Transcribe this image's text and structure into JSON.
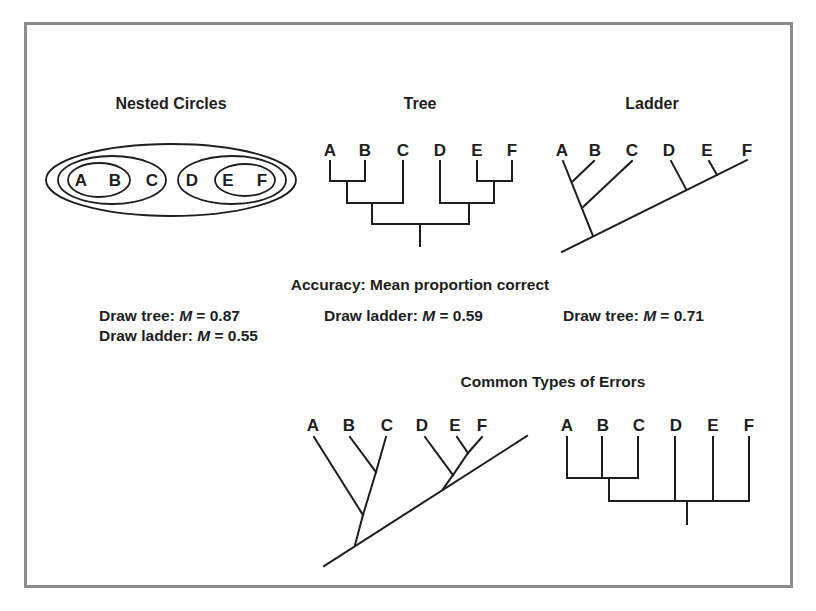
{
  "sections": {
    "nested_circles": {
      "title": "Nested Circles",
      "labels": [
        "A",
        "B",
        "C",
        "D",
        "E",
        "F"
      ]
    },
    "tree": {
      "title": "Tree",
      "labels": [
        "A",
        "B",
        "C",
        "D",
        "E",
        "F"
      ]
    },
    "ladder": {
      "title": "Ladder",
      "labels": [
        "A",
        "B",
        "C",
        "D",
        "E",
        "F"
      ]
    }
  },
  "accuracy": {
    "title": "Accuracy: Mean proportion correct",
    "results": [
      {
        "prefix": "Draw tree: ",
        "stat": "M",
        "value": " = 0.87"
      },
      {
        "prefix": "Draw ladder: ",
        "stat": "M",
        "value": " = 0.55"
      },
      {
        "prefix": "Draw ladder: ",
        "stat": "M",
        "value": " = 0.59"
      },
      {
        "prefix": "Draw tree: ",
        "stat": "M",
        "value": " = 0.71"
      }
    ]
  },
  "errors": {
    "title": "Common Types of Errors",
    "ladder_labels": [
      "A",
      "B",
      "C",
      "D",
      "E",
      "F"
    ],
    "tree_labels": [
      "A",
      "B",
      "C",
      "D",
      "E",
      "F"
    ]
  },
  "colors": {
    "ink": "#1e1e1e",
    "frame": "#8c8c8c",
    "background": "#ffffff"
  }
}
